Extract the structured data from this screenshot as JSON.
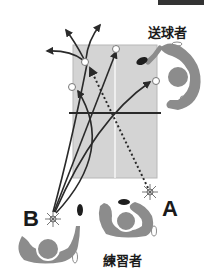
{
  "labels": {
    "server": "送球者",
    "practicer": "練習者",
    "position_a": "A",
    "position_b": "B"
  },
  "colors": {
    "table": "#d4d4d4",
    "table_border": "#b8b8b8",
    "net": "#2a2a2a",
    "figure": "#8c8c8c",
    "paddle": "#1e1e1e",
    "arrow": "#2a2a2a",
    "text": "#1a1a1a"
  },
  "diagram": {
    "table": {
      "x": 73,
      "y": 45,
      "w": 84,
      "h": 133
    },
    "net_y": 113,
    "center_line_x": 115,
    "landing_points": [
      [
        85,
        62
      ],
      [
        118,
        49
      ],
      [
        71,
        87
      ],
      [
        155,
        80
      ]
    ],
    "hit_points": {
      "A": [
        150,
        190
      ],
      "B": [
        53,
        213
      ]
    }
  }
}
